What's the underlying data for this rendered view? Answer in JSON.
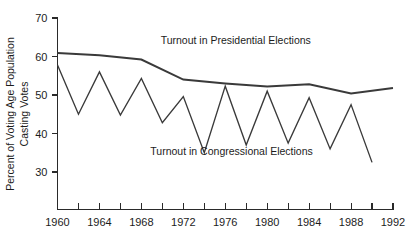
{
  "chart_data": {
    "type": "line",
    "title": "",
    "xlabel": "",
    "ylabel": "Percent of Voting Age Population Casting Votes",
    "ylabel_line1": "Percent of Voting Age Population",
    "ylabel_line2": "Casting Votes",
    "xlim": [
      1960,
      1992
    ],
    "ylim": [
      25,
      70
    ],
    "yticks": [
      30,
      40,
      50,
      60,
      70
    ],
    "ytick_labels": [
      "30",
      "40",
      "50",
      "60",
      "70"
    ],
    "xticks": [
      1960,
      1962,
      1964,
      1966,
      1968,
      1970,
      1972,
      1974,
      1976,
      1978,
      1980,
      1982,
      1984,
      1986,
      1988,
      1990,
      1992
    ],
    "xtick_labels_shown": [
      "1960",
      "1964",
      "1968",
      "1972",
      "1976",
      "1980",
      "1984",
      "1988",
      "1992"
    ],
    "xtick_labeled_years": [
      1960,
      1964,
      1968,
      1972,
      1976,
      1980,
      1984,
      1988,
      1992
    ],
    "grid": false,
    "legend_position": "inline-annotation",
    "line_color": "#3a3a3a",
    "axis_color": "#2a2a2a",
    "series": [
      {
        "name": "Turnout in Presidential Elections",
        "annotation": "Turnout in Presidential Elections",
        "annotation_x": 1977.0,
        "annotation_y": 63.2,
        "x": [
          1960,
          1964,
          1968,
          1972,
          1976,
          1980,
          1984,
          1988,
          1992
        ],
        "values": [
          60.9,
          60.3,
          59.2,
          54.0,
          53.0,
          52.2,
          52.8,
          50.4,
          51.8
        ]
      },
      {
        "name": "Turnout in Congressional Elections",
        "annotation": "Turnout in Congressional Elections",
        "annotation_x": 1976.6,
        "annotation_y": 34.4,
        "x": [
          1960,
          1962,
          1964,
          1966,
          1968,
          1970,
          1972,
          1974,
          1976,
          1978,
          1980,
          1982,
          1984,
          1986,
          1988,
          1990
        ],
        "values": [
          57.8,
          45.0,
          56.0,
          44.8,
          54.3,
          42.8,
          49.6,
          35.0,
          52.3,
          37.0,
          51.0,
          37.5,
          49.3,
          36.0,
          47.5,
          32.5
        ]
      }
    ]
  }
}
